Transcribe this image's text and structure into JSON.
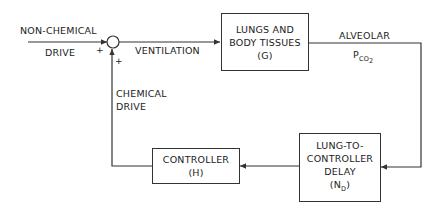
{
  "diagram": {
    "type": "block-diagram",
    "inputs": {
      "non_chemical_drive": {
        "line1": "NON-CHEMICAL",
        "line2": "DRIVE",
        "sign": "+"
      },
      "chemical_drive": {
        "line1": "CHEMICAL",
        "line2": "DRIVE",
        "sign": "+"
      }
    },
    "signals": {
      "ventilation": "VENTILATION",
      "alveolar": "ALVEOLAR",
      "pco2_main": "P",
      "pco2_sub": "CO",
      "pco2_subsub": "2"
    },
    "blocks": {
      "lungs": {
        "line1": "LUNGS AND",
        "line2": "BODY TISSUES",
        "line3": "(G)"
      },
      "delay": {
        "line1": "LUNG-TO-",
        "line2": "CONTROLLER",
        "line3": "DELAY",
        "line4_pre": "(N",
        "line4_sub": "D",
        "line4_post": ")"
      },
      "controller": {
        "line1": "CONTROLLER",
        "line2": "(H)"
      }
    },
    "colors": {
      "line": "#333333",
      "text": "#222222",
      "background": "#ffffff"
    }
  }
}
